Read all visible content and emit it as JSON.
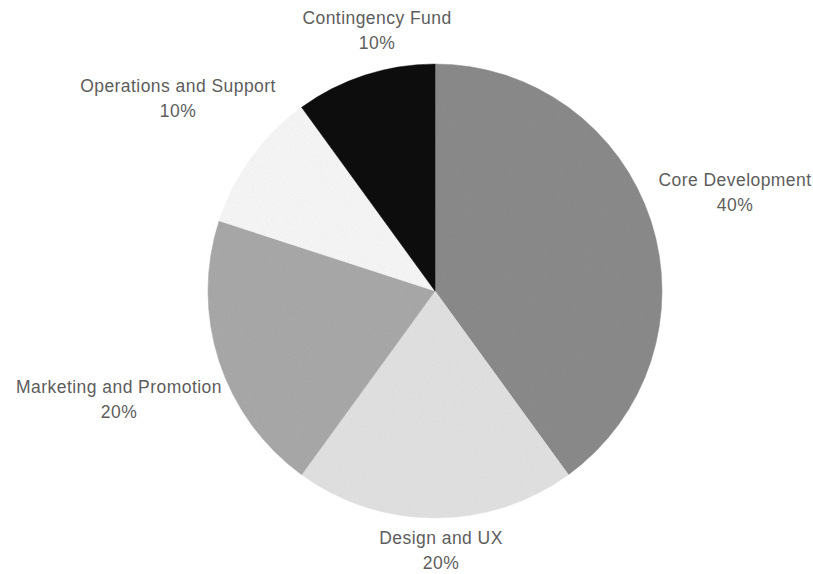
{
  "chart_data": {
    "type": "pie",
    "title": "",
    "categories": [
      "Core Development",
      "Design and UX",
      "Marketing and Promotion",
      "Operations and Support",
      "Contingency Fund"
    ],
    "values": [
      40,
      20,
      20,
      10,
      10
    ],
    "value_labels": [
      "40%",
      "20%",
      "20%",
      "10%",
      "10%"
    ],
    "unit": "%",
    "start_angle_deg": 0,
    "direction": "clockwise",
    "legend": "none",
    "labels_position": "outside",
    "grid": false,
    "background_color": "#ffffff",
    "label_text_color": "#5d5d5d",
    "slice_colors": [
      "#8b8b8b",
      "#e2e2e2",
      "#a9a9a9",
      "#f7f7f7",
      "#0d0d0d"
    ],
    "slices": [
      {
        "name": "Core Development",
        "percent": 40,
        "percent_label": "40%",
        "color": "#8b8b8b",
        "start_deg": 0,
        "end_deg": 144
      },
      {
        "name": "Design and UX",
        "percent": 20,
        "percent_label": "20%",
        "color": "#e2e2e2",
        "start_deg": 144,
        "end_deg": 216
      },
      {
        "name": "Marketing and Promotion",
        "percent": 20,
        "percent_label": "20%",
        "color": "#a9a9a9",
        "start_deg": 216,
        "end_deg": 288
      },
      {
        "name": "Operations and Support",
        "percent": 10,
        "percent_label": "10%",
        "color": "#f7f7f7",
        "start_deg": 288,
        "end_deg": 324
      },
      {
        "name": "Contingency Fund",
        "percent": 10,
        "percent_label": "10%",
        "color": "#0d0d0d",
        "start_deg": 324,
        "end_deg": 360
      }
    ],
    "geometry": {
      "center_x": 435,
      "center_y": 291,
      "radius": 227
    }
  }
}
